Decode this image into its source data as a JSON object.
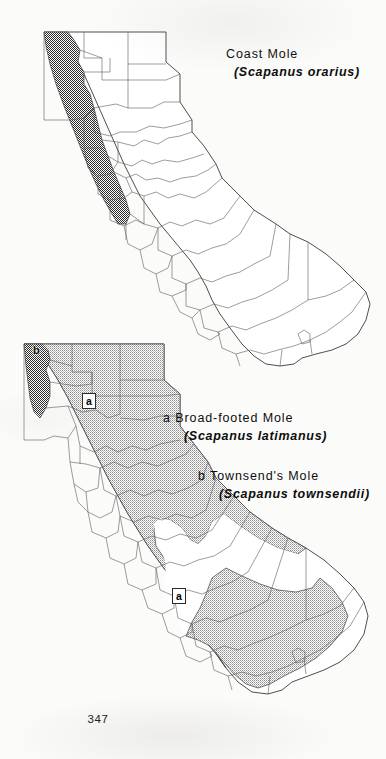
{
  "page": {
    "number": "347",
    "background_color": "#fbfbfa",
    "ink_color": "#0d0d0d"
  },
  "maps": [
    {
      "id": "map-coast-mole",
      "region": "California",
      "map_type": "species-distribution",
      "boundaries": "county",
      "range_shading": "stipple",
      "range_description": "Narrow coastal strip along the far northwestern coast of California (Del Norte and Humboldt counties)",
      "markers": []
    },
    {
      "id": "map-broad-footed-and-townsends-mole",
      "region": "California",
      "map_type": "species-distribution",
      "boundaries": "county",
      "range_shading": "stipple",
      "range_description": "Broad-footed Mole (a) covers most of California except the Central Valley and southeastern deserts; Townsend's Mole (b) occupies the extreme northwest corner",
      "markers": [
        {
          "key": "a",
          "label": "a",
          "position": "northern-sierra"
        },
        {
          "key": "a",
          "label": "a",
          "position": "southern-california"
        },
        {
          "key": "b",
          "label": "b",
          "position": "northwest-corner"
        }
      ]
    }
  ],
  "legends": [
    {
      "id": "legend-coast-mole",
      "key": "",
      "common_name": "Coast Mole",
      "scientific_name": "(Scapanus orarius)"
    },
    {
      "id": "legend-broad-footed-mole",
      "key": "a",
      "common_name": "a Broad-footed Mole",
      "scientific_name": "(Scapanus latimanus)"
    },
    {
      "id": "legend-townsends-mole",
      "key": "b",
      "common_name": "b Townsend's Mole",
      "scientific_name": "(Scapanus townsendii)"
    }
  ]
}
